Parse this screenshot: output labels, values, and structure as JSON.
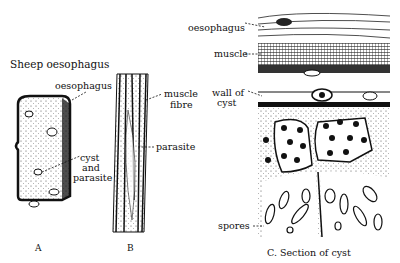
{
  "title": "Sheep oesophagus",
  "panel_a": {
    "label_oesophagus": "oesophagus",
    "label_cyst": "cyst",
    "label_and": "and",
    "label_parasite": "parasite",
    "caption": "A"
  },
  "panel_b": {
    "label_muscle": "muscle",
    "label_fibre": "fibre",
    "label_parasite": "parasite",
    "caption": "B"
  },
  "panel_c": {
    "label_oesophagus": "oesophagus",
    "label_muscle": "muscle",
    "label_wall": "wall of",
    "label_cyst": "cyst",
    "label_spores": "spores",
    "caption": "C. Section of cyst"
  }
}
